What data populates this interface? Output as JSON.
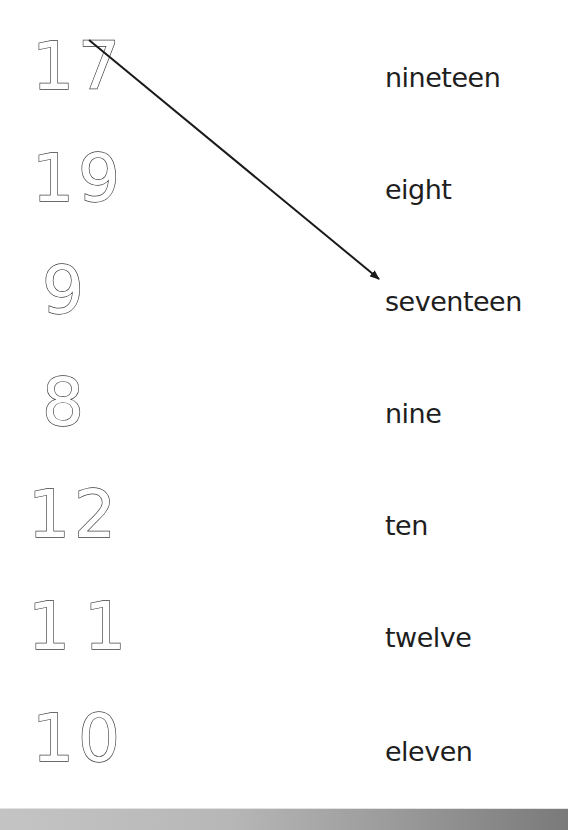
{
  "worksheet": {
    "numbers": [
      "17",
      "19",
      "9",
      "8",
      "12",
      "11",
      "10"
    ],
    "words": [
      "nineteen",
      "eight",
      "seventeen",
      "nine",
      "ten",
      "twelve",
      "eleven"
    ],
    "matched_lines": [
      {
        "from_number": "17",
        "to_word": "seventeen",
        "x1": 89,
        "y1": 40,
        "x2": 379,
        "y2": 279
      }
    ]
  },
  "colors": {
    "line": "#1a1a1a",
    "numeral_outline": "#3a3a3a",
    "word_text": "#1e1e1e",
    "bar_light": "#c4c4c4",
    "bar_dark": "#7a7a7a"
  }
}
